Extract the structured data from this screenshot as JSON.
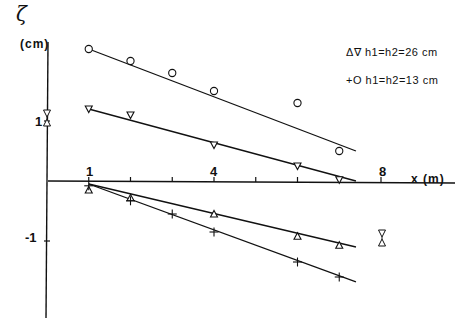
{
  "chart_data": {
    "type": "scatter",
    "title": "",
    "xlabel": "x (m)",
    "ylabel": "ζ (cm)",
    "ylabel_symbol": "ζ",
    "ylabel_unit": "(cm)",
    "xlim": [
      0,
      10
    ],
    "ylim": [
      -2.6,
      2.3
    ],
    "grid": false,
    "legend_position": "top-right",
    "x_ticks": [
      1,
      2,
      3,
      4,
      5,
      6,
      7,
      8
    ],
    "x_tick_labels": {
      "1": "1",
      "4": "4",
      "8": "8"
    },
    "y_ticks": [
      1,
      -1
    ],
    "y_tick_labels": [
      "1",
      "-1"
    ],
    "legend": [
      {
        "markers": "Δ∇",
        "label": "h1=h2=26 cm"
      },
      {
        "markers": "+O",
        "label": "h1=h2=13 cm"
      }
    ],
    "series": [
      {
        "name": "h1=h2=13 cm (crest, O)",
        "marker": "circle",
        "x": [
          1.0,
          2.0,
          3.0,
          4.0,
          6.0,
          7.0
        ],
        "y": [
          2.2,
          2.0,
          1.8,
          1.5,
          1.3,
          0.5
        ],
        "fit_line": {
          "x": [
            1.0,
            7.4
          ],
          "y": [
            2.2,
            0.5
          ]
        }
      },
      {
        "name": "h1=h2=26 cm (crest, ∇)",
        "marker": "triangle-down",
        "x": [
          1.0,
          2.0,
          4.0,
          6.0,
          7.0
        ],
        "y": [
          1.2,
          1.1,
          0.6,
          0.25,
          0.02
        ],
        "fit_line": {
          "x": [
            1.0,
            7.4
          ],
          "y": [
            1.2,
            0.0
          ]
        }
      },
      {
        "name": "h1=h2=26 cm (trough, Δ)",
        "marker": "triangle-up",
        "x": [
          1.0,
          2.0,
          4.0,
          6.0,
          7.0
        ],
        "y": [
          -0.15,
          -0.28,
          -0.55,
          -0.92,
          -1.07
        ],
        "fit_line": {
          "x": [
            1.0,
            7.4
          ],
          "y": [
            -0.05,
            -1.1
          ]
        }
      },
      {
        "name": "h1=h2=13 cm (trough, +)",
        "marker": "plus",
        "x": [
          1.0,
          2.0,
          3.0,
          4.0,
          6.0,
          7.0
        ],
        "y": [
          -0.08,
          -0.33,
          -0.55,
          -0.85,
          -1.35,
          -1.6
        ],
        "fit_line": {
          "x": [
            1.0,
            7.4
          ],
          "y": [
            -0.05,
            -1.68
          ]
        }
      }
    ],
    "annotations": [
      {
        "description": "error-range marker on y-axis near y=1",
        "x": 0,
        "y": 1.05
      },
      {
        "description": "error-range marker near x=8",
        "x": 8.1,
        "y": -1.0
      }
    ]
  }
}
